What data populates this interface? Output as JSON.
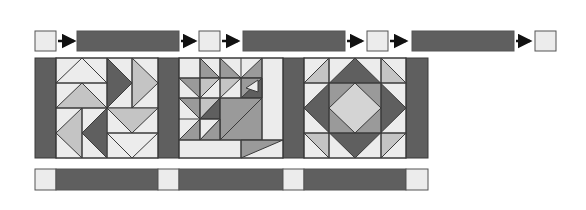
{
  "diagram": {
    "colors": {
      "dark": "#5f5f5f",
      "medium": "#9a9a9a",
      "light_medium": "#c4c4c4",
      "light": "#ececec",
      "outline": "#3a3a3a",
      "arrow": "#111111"
    },
    "sashing_row": {
      "sequence": [
        "cornerstone",
        "arrow",
        "sashing",
        "arrow",
        "cornerstone",
        "arrow",
        "sashing",
        "arrow",
        "cornerstone",
        "arrow",
        "sashing",
        "arrow",
        "cornerstone"
      ]
    },
    "blocks": [
      {
        "name": "flying-geese-block",
        "position": 1
      },
      {
        "name": "basket-block",
        "position": 2
      },
      {
        "name": "square-in-square-block",
        "position": 3
      }
    ],
    "bottom_strip": {
      "sequence": [
        "cornerstone",
        "sashing",
        "cornerstone",
        "sashing",
        "cornerstone",
        "sashing",
        "cornerstone"
      ]
    }
  }
}
